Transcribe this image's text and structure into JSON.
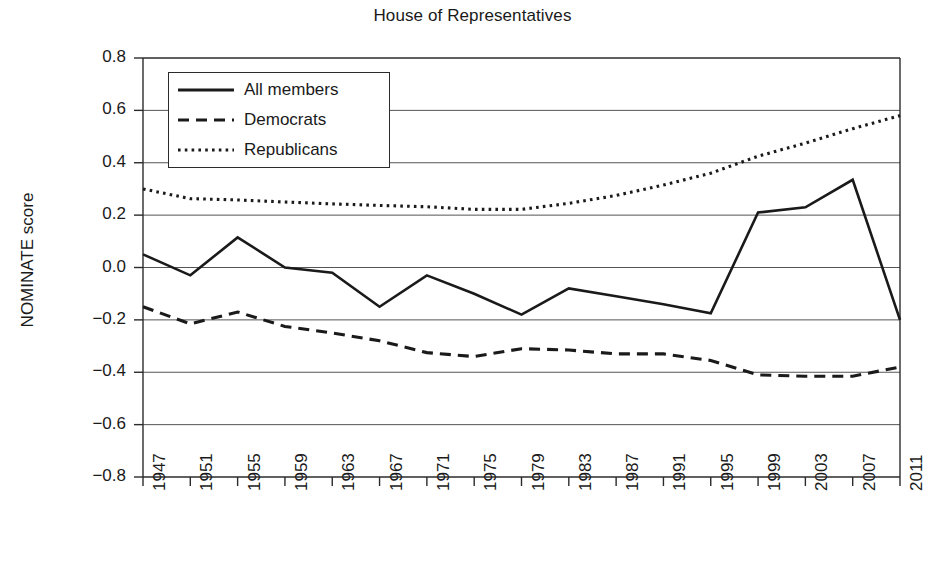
{
  "chart_data": {
    "type": "line",
    "title": "House of Representatives",
    "xlabel": "",
    "ylabel": "NOMINATE score",
    "ylim": [
      -0.8,
      0.8
    ],
    "ytick_labels": [
      "0.8",
      "0.6",
      "0.4",
      "0.2",
      "0.0",
      "−0.2",
      "−0.4",
      "−0.6",
      "−0.8"
    ],
    "ytick_values": [
      0.8,
      0.6,
      0.4,
      0.2,
      0.0,
      -0.2,
      -0.4,
      -0.6,
      -0.8
    ],
    "grid": true,
    "grid_axis": "y",
    "legend_position": "upper-left-inside",
    "categories": [
      "1947",
      "1951",
      "1955",
      "1959",
      "1963",
      "1967",
      "1971",
      "1975",
      "1979",
      "1983",
      "1987",
      "1991",
      "1995",
      "1999",
      "2003",
      "2007",
      "2011"
    ],
    "x": [
      1947,
      1951,
      1955,
      1959,
      1963,
      1967,
      1971,
      1975,
      1979,
      1983,
      1987,
      1991,
      1995,
      1999,
      2003,
      2007,
      2011
    ],
    "series": [
      {
        "name": "All members",
        "style": "solid",
        "color": "#1a1a1a",
        "values": [
          0.05,
          -0.03,
          0.115,
          0.0,
          -0.02,
          -0.15,
          -0.03,
          -0.1,
          -0.18,
          -0.08,
          -0.11,
          -0.14,
          -0.175,
          0.21,
          0.23,
          0.335,
          -0.2
        ]
      },
      {
        "name": "Democrats",
        "style": "dashed",
        "color": "#1a1a1a",
        "values": [
          -0.15,
          -0.215,
          -0.17,
          -0.225,
          -0.25,
          -0.28,
          -0.325,
          -0.34,
          -0.31,
          -0.315,
          -0.33,
          -0.33,
          -0.355,
          -0.41,
          -0.415,
          -0.415,
          -0.38
        ]
      },
      {
        "name": "Republicans",
        "style": "dotted",
        "color": "#1a1a1a",
        "values": [
          0.3,
          0.263,
          0.258,
          0.25,
          0.243,
          0.237,
          0.232,
          0.222,
          0.222,
          0.245,
          0.275,
          0.315,
          0.36,
          0.425,
          0.475,
          0.53,
          0.58
        ]
      }
    ]
  },
  "axes": {
    "left_px": 143,
    "right_px": 900,
    "top_px": 58,
    "bottom_px": 477
  },
  "legend": {
    "entries": [
      {
        "label": "All members",
        "style": "solid"
      },
      {
        "label": "Democrats",
        "style": "dashed"
      },
      {
        "label": "Republicans",
        "style": "dotted"
      }
    ]
  }
}
